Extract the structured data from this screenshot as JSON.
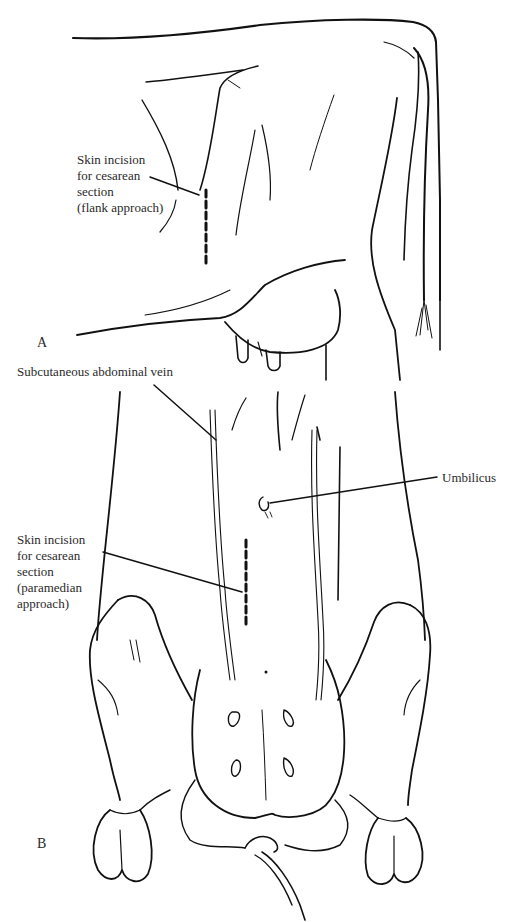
{
  "figure": {
    "panels": [
      {
        "letter": "A",
        "view": "lateral",
        "labels": [
          {
            "id": "flank",
            "lines": [
              "Skin incision",
              "for cesarean",
              "section",
              "(flank approach)"
            ]
          }
        ]
      },
      {
        "letter": "B",
        "view": "ventral",
        "labels": [
          {
            "id": "vein",
            "lines": [
              "Subcutaneous abdominal vein"
            ]
          },
          {
            "id": "umbilicus",
            "lines": [
              "Umbilicus"
            ]
          },
          {
            "id": "paramedian",
            "lines": [
              "Skin incision",
              "for cesarean",
              "section",
              "(paramedian",
              "approach)"
            ]
          }
        ]
      }
    ],
    "colors": {
      "ink": "#111111",
      "label": "#2a2a2a",
      "background": "#ffffff"
    }
  }
}
